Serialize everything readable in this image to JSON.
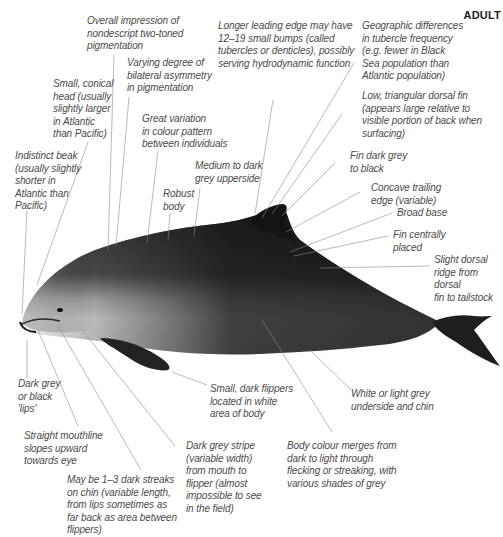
{
  "header": {
    "tag": "ADULT"
  },
  "colors": {
    "dark_back": "#1b1b1b",
    "mid_grey": "#6e6e6e",
    "belly": "#f2f2f2",
    "text": "#4a4a4a",
    "leader_line": "#8a8a8a"
  },
  "annotations": [
    {
      "id": "overall-impression",
      "text": "Overall impression of\nnondescript two-toned\npigmentation"
    },
    {
      "id": "bilateral-asymmetry",
      "text": "Varying degree of\nbilateral asymmetry\nin pigmentation"
    },
    {
      "id": "conical-head",
      "text": "Small, conical\nhead (usually\nslightly larger\nin Atlantic\nthan Pacific)"
    },
    {
      "id": "colour-variation",
      "text": "Great variation\nin colour pattern\nbetween individuals"
    },
    {
      "id": "indistinct-beak",
      "text": "Indistinct beak\n(usually slightly\nshorter in\nAtlantic than\nPacific)"
    },
    {
      "id": "robust-body",
      "text": "Robust\nbody"
    },
    {
      "id": "upperside",
      "text": "Medium to dark\ngrey upperside"
    },
    {
      "id": "leading-edge",
      "text": "Longer leading edge may have\n12–19 small bumps (called\ntubercles or denticles), possibly\nserving hydrodynamic function"
    },
    {
      "id": "geographic-differences",
      "text": "Geographic differences\nin tubercle frequency\n(e.g. fewer in Black\nSea population than\nAtlantic population)"
    },
    {
      "id": "dorsal-fin",
      "text": "Low, triangular dorsal fin\n(appears large relative to\nvisible portion of back when\nsurfacing)"
    },
    {
      "id": "fin-colour",
      "text": "Fin dark grey\nto black"
    },
    {
      "id": "trailing-edge",
      "text": "Concave trailing\nedge (variable)"
    },
    {
      "id": "broad-base",
      "text": "Broad base"
    },
    {
      "id": "fin-placement",
      "text": "Fin centrally\nplaced"
    },
    {
      "id": "dorsal-ridge",
      "text": "Slight dorsal\nridge from dorsal\nfin to tailstock"
    },
    {
      "id": "lips",
      "text": "Dark grey\nor black\n'lips'"
    },
    {
      "id": "mouthline",
      "text": "Straight mouthline\nslopes upward\ntowards eye"
    },
    {
      "id": "flippers",
      "text": "Small, dark flippers\nlocated in white\narea of body"
    },
    {
      "id": "underside",
      "text": "White or light grey\nunderside and chin"
    },
    {
      "id": "chin-streaks",
      "text": "May be 1–3 dark streaks\non chin (variable length,\nfrom lips sometimes as\nfar back as area between\nflippers)"
    },
    {
      "id": "grey-stripe",
      "text": "Dark grey stripe\n(variable width)\nfrom mouth to\nflipper (almost\nimpossible to see\nin the field)"
    },
    {
      "id": "colour-merge",
      "text": "Body colour merges from\ndark to light through\nflecking or streaking, with\nvarious shades of grey"
    }
  ]
}
